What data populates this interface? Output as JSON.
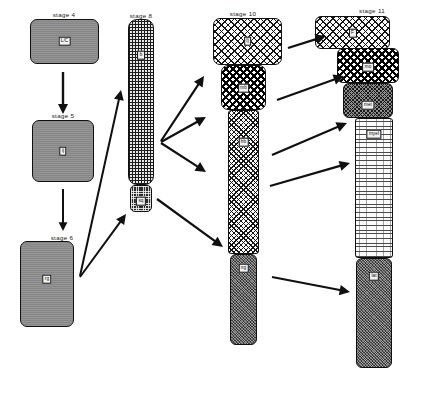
{
  "figure": {
    "background_color": "#ffffff",
    "ink_color": "#101010",
    "width": 442,
    "height": 411
  },
  "stages": [
    {
      "id": "stage-4",
      "title": "stage 4",
      "title_x": 64,
      "title_y": 11,
      "blocks": [
        {
          "name": "stage4-block-a",
          "label": "L/C",
          "texture": "tex-grey",
          "x": 30,
          "y": 19,
          "w": 69,
          "h": 45,
          "radius": 7,
          "label_y": 22
        }
      ]
    },
    {
      "id": "stage-5",
      "title": "stage 5",
      "title_x": 63,
      "title_y": 112,
      "blocks": [
        {
          "name": "stage5-block-a",
          "label": "ij",
          "texture": "tex-grey",
          "x": 32,
          "y": 120,
          "w": 62,
          "h": 62,
          "radius": 7,
          "label_y": 31
        }
      ]
    },
    {
      "id": "stage-6",
      "title": "stage 6",
      "title_x": 62,
      "title_y": 234,
      "blocks": [
        {
          "name": "stage6-block-a",
          "label": "rg",
          "texture": "tex-grey",
          "x": 20,
          "y": 241,
          "w": 54,
          "h": 86,
          "radius": 7,
          "label_y": 38
        }
      ]
    },
    {
      "id": "stage-8",
      "title": "stage 8",
      "title_x": 141,
      "title_y": 12,
      "blocks": [
        {
          "name": "stage8-block-grid",
          "label": "b",
          "texture": "tex-grid",
          "x": 128,
          "y": 19,
          "w": 26,
          "h": 166,
          "radius": 9,
          "label_y": 36
        },
        {
          "name": "stage8-block-foot",
          "label": "sq",
          "texture": "tex-darkdot",
          "x": 130,
          "y": 185,
          "w": 22,
          "h": 27,
          "radius": 5,
          "label_y": 16
        }
      ]
    },
    {
      "id": "stage-10",
      "title": "stage 10",
      "title_x": 243,
      "title_y": 10,
      "blocks": [
        {
          "name": "stage10-block-head",
          "label": "fj",
          "texture": "tex-checker",
          "x": 213,
          "y": 18,
          "w": 69,
          "h": 47,
          "radius": 7,
          "label_y": 23
        },
        {
          "name": "stage10-block-dots",
          "label": "mb",
          "texture": "tex-bolddot",
          "x": 221,
          "y": 65,
          "w": 45,
          "h": 45,
          "radius": 7,
          "label_y": 23
        },
        {
          "name": "stage10-block-shaft",
          "label": "hb",
          "texture": "tex-hatchmed",
          "x": 228,
          "y": 110,
          "w": 31,
          "h": 144,
          "radius": 3,
          "label_y": 32
        },
        {
          "name": "stage10-block-foot",
          "label": "ng",
          "texture": "tex-stipple",
          "x": 230,
          "y": 254,
          "w": 27,
          "h": 91,
          "radius": 6,
          "label_y": 14
        }
      ]
    },
    {
      "id": "stage-11",
      "title": "stage 11",
      "title_x": 372,
      "title_y": 7,
      "blocks": [
        {
          "name": "stage11-block-head",
          "label": "F",
          "texture": "tex-checker",
          "x": 315,
          "y": 16,
          "w": 75,
          "h": 33,
          "radius": 6,
          "label_y": 17
        },
        {
          "name": "stage11-block-dots",
          "label": "mo",
          "texture": "tex-bolddot",
          "x": 337,
          "y": 48,
          "w": 62,
          "h": 35,
          "radius": 6,
          "label_y": 19
        },
        {
          "name": "stage11-block-greyhatch",
          "label": "met",
          "texture": "tex-greyhatch",
          "x": 343,
          "y": 83,
          "w": 50,
          "h": 35,
          "radius": 6,
          "label_y": 22
        },
        {
          "name": "stage11-block-lines",
          "label": "myel",
          "texture": "tex-hlines",
          "x": 355,
          "y": 118,
          "w": 38,
          "h": 140,
          "radius": 3,
          "label_y": 16
        },
        {
          "name": "stage11-block-foot",
          "label": "lat",
          "texture": "tex-stipple",
          "x": 356,
          "y": 258,
          "w": 36,
          "h": 110,
          "radius": 6,
          "label_y": 18
        }
      ]
    }
  ],
  "arrows": [
    {
      "name": "arrow-stage4-to-stage5",
      "x1": 63,
      "y1": 72,
      "x2": 63,
      "y2": 114,
      "width": 2.4,
      "head": 5.0
    },
    {
      "name": "arrow-stage5-to-stage6",
      "x1": 63,
      "y1": 189,
      "x2": 63,
      "y2": 231,
      "width": 2.0,
      "head": 4.4
    },
    {
      "name": "arrow-stage6-to-stage8-upper",
      "x1": 80,
      "y1": 276,
      "x2": 121,
      "y2": 90,
      "width": 2.0,
      "head": 5.0
    },
    {
      "name": "arrow-stage6-to-stage8-foot",
      "x1": 80,
      "y1": 277,
      "x2": 126,
      "y2": 214,
      "width": 2.0,
      "head": 5.0
    },
    {
      "name": "arrow-stage8-to-stage10-head",
      "x1": 161,
      "y1": 141,
      "x2": 204,
      "y2": 76,
      "width": 2.2,
      "head": 5.2
    },
    {
      "name": "arrow-stage8-to-stage10-dots",
      "x1": 161,
      "y1": 142,
      "x2": 206,
      "y2": 117,
      "width": 2.2,
      "head": 5.2
    },
    {
      "name": "arrow-stage8-to-stage10-shaft",
      "x1": 161,
      "y1": 143,
      "x2": 206,
      "y2": 172,
      "width": 2.2,
      "head": 5.2
    },
    {
      "name": "arrow-stage8foot-to-stage10-foot",
      "x1": 157,
      "y1": 199,
      "x2": 223,
      "y2": 247,
      "width": 2.2,
      "head": 5.2
    },
    {
      "name": "arrow-stage10-to-stage11-head",
      "x1": 288,
      "y1": 48,
      "x2": 326,
      "y2": 36,
      "width": 2.2,
      "head": 5.2
    },
    {
      "name": "arrow-stage10-to-stage11-dots",
      "x1": 277,
      "y1": 100,
      "x2": 344,
      "y2": 76,
      "width": 2.2,
      "head": 5.2
    },
    {
      "name": "arrow-stage10-to-stage11-grey",
      "x1": 272,
      "y1": 155,
      "x2": 347,
      "y2": 123,
      "width": 2.2,
      "head": 5.2
    },
    {
      "name": "arrow-stage10-to-stage11-lines",
      "x1": 270,
      "y1": 186,
      "x2": 350,
      "y2": 163,
      "width": 2.2,
      "head": 5.2
    },
    {
      "name": "arrow-stage10foot-to-stage11-foot",
      "x1": 272,
      "y1": 277,
      "x2": 350,
      "y2": 292,
      "width": 2.2,
      "head": 5.2
    }
  ]
}
